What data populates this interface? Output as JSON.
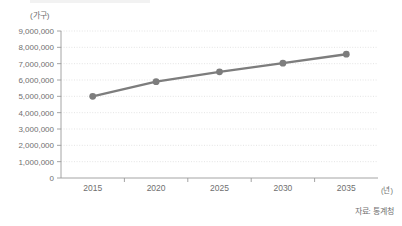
{
  "chart_data": {
    "type": "line",
    "title": "",
    "xlabel": "(년)",
    "ylabel": "(가구)",
    "categories": [
      "2015",
      "2020",
      "2025",
      "2030",
      "2035"
    ],
    "series": [
      {
        "name": "가구 수",
        "values": [
          5000000,
          5900000,
          6500000,
          7030000,
          7580000
        ]
      }
    ],
    "ylim": [
      0,
      9000000
    ],
    "ytick_values": [
      0,
      1000000,
      2000000,
      3000000,
      4000000,
      5000000,
      6000000,
      7000000,
      8000000,
      9000000
    ],
    "ytick_labels": [
      "0",
      "1,000,000",
      "2,000,000",
      "3,000,000",
      "4,000,000",
      "5,000,000",
      "6,000,000",
      "7,000,000",
      "8,000,000",
      "9,000,000"
    ],
    "grid": true,
    "grid_style": "dotted",
    "legend": false,
    "legend_position": "none",
    "marker": "circle",
    "series_color": "#7d7d7d",
    "grid_color": "#d8d8d8",
    "axis_color": "#9a9a9a",
    "text_color": "#6f6f6f",
    "background": "#ffffff"
  },
  "annotations": {
    "source_note": "자료: 통계청"
  }
}
